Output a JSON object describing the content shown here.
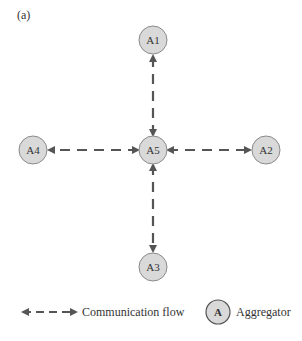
{
  "panel_label": "(a)",
  "colors": {
    "node_fill": "#d9d9d9",
    "node_stroke": "#777777",
    "arrow": "#555555",
    "text": "#333333"
  },
  "nodes": [
    {
      "id": "A1",
      "label": "A1",
      "cx": 153,
      "cy": 40
    },
    {
      "id": "A2",
      "label": "A2",
      "cx": 266,
      "cy": 150
    },
    {
      "id": "A3",
      "label": "A3",
      "cx": 153,
      "cy": 267
    },
    {
      "id": "A4",
      "label": "A4",
      "cx": 33,
      "cy": 150
    },
    {
      "id": "A5",
      "label": "A5",
      "cx": 153,
      "cy": 150
    }
  ],
  "edges": [
    {
      "from": "A5",
      "to": "A1",
      "type": "bidirectional-dashed"
    },
    {
      "from": "A5",
      "to": "A2",
      "type": "bidirectional-dashed"
    },
    {
      "from": "A5",
      "to": "A3",
      "type": "bidirectional-dashed"
    },
    {
      "from": "A5",
      "to": "A4",
      "type": "bidirectional-dashed"
    }
  ],
  "legend": {
    "flow_label": "Communication flow",
    "aggregator_symbol": "A",
    "aggregator_label": "Aggregator"
  }
}
